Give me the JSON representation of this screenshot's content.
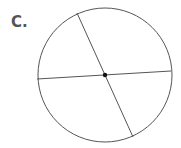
{
  "label": "C.",
  "diagram": {
    "shape": "circle",
    "center": [
      105,
      75
    ],
    "radius": 67,
    "stroke_color": "#555555",
    "center_dot_color": "#111111",
    "lines": [
      {
        "from": [
          77,
          13
        ],
        "to": [
          133,
          137
        ]
      },
      {
        "from": [
          37,
          79
        ],
        "to": [
          171,
          71
        ]
      }
    ]
  }
}
